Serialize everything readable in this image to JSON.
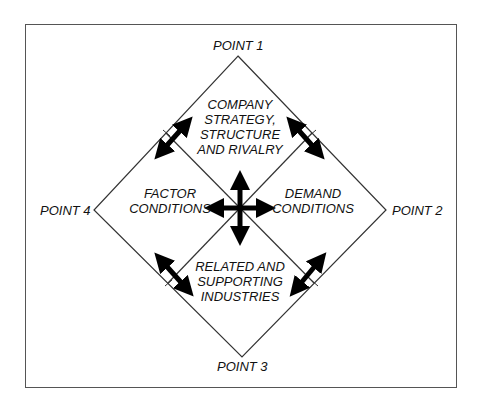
{
  "diagram": {
    "type": "porter-diamond",
    "points": {
      "top": "POINT 1",
      "right": "POINT 2",
      "bottom": "POINT 3",
      "left": "POINT 4"
    },
    "regions": {
      "top": [
        "COMPANY",
        "STRATEGY,",
        "STRUCTURE",
        "AND RIVALRY"
      ],
      "left": [
        "FACTOR",
        "CONDITIONS"
      ],
      "right": [
        "DEMAND",
        "CONDITIONS"
      ],
      "bottom": [
        "RELATED AND",
        "SUPPORTING",
        "INDUSTRIES"
      ]
    },
    "icons": {
      "center": "four-way-arrow-icon",
      "edges": "double-headed-arrow-icon"
    },
    "colors": {
      "line": "#333333",
      "arrow": "#000000",
      "frame": "#555555",
      "background": "#ffffff"
    }
  }
}
